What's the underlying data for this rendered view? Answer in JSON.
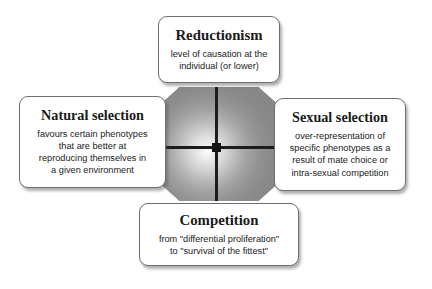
{
  "diagram": {
    "background_color": "#ffffff",
    "center": {
      "shape_name": "octagon",
      "gradient_center_color": "#fbfbfb",
      "gradient_edge_color": "#878787",
      "crosshair_color": "#1c1c1c"
    },
    "boxes": [
      {
        "id": "reductionism",
        "position": "top",
        "title": "Reductionism",
        "lines": [
          "level of causation at the",
          "individual (or lower)"
        ]
      },
      {
        "id": "natural-selection",
        "position": "left",
        "title": "Natural selection",
        "lines": [
          "favours certain phenotypes",
          "that are better at",
          "reproducing themselves in",
          "a given environment"
        ]
      },
      {
        "id": "sexual-selection",
        "position": "right",
        "title": "Sexual selection",
        "lines": [
          "over-representation of",
          "specific phenotypes as a",
          "result of mate choice or",
          "intra-sexual competition"
        ]
      },
      {
        "id": "competition",
        "position": "bottom",
        "title": "Competition",
        "lines": [
          "from \"differential proliferation\"",
          "to \"survival of the fittest\""
        ]
      }
    ]
  }
}
